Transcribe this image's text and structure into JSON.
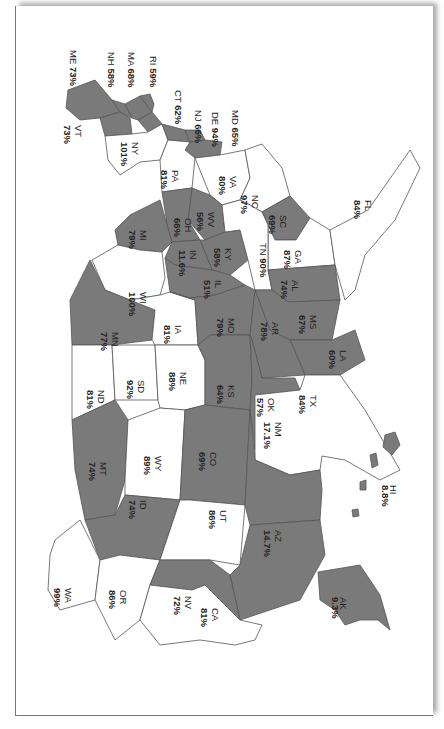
{
  "map": {
    "orientation": "rotated 90 degrees clockwise",
    "colors": {
      "shaded": "#7a7a7a",
      "unshaded": "#ffffff",
      "border": "#555555"
    },
    "states": [
      {
        "code": "ME",
        "value": "73%",
        "shaded": true
      },
      {
        "code": "NH",
        "value": "58%",
        "shaded": true
      },
      {
        "code": "MA",
        "value": "68%",
        "shaded": true
      },
      {
        "code": "RI",
        "value": "59%",
        "shaded": true
      },
      {
        "code": "CT",
        "value": "62%",
        "shaded": true
      },
      {
        "code": "NJ",
        "value": "66%",
        "shaded": true
      },
      {
        "code": "DE",
        "value": "94%",
        "shaded": true
      },
      {
        "code": "MD",
        "value": "65%",
        "shaded": true
      },
      {
        "code": "VT",
        "value": "73%",
        "shaded": true
      },
      {
        "code": "NY",
        "value": "101%",
        "shaded": false
      },
      {
        "code": "PA",
        "value": "81%",
        "shaded": false
      },
      {
        "code": "VA",
        "value": "80%",
        "shaded": false
      },
      {
        "code": "NC",
        "value": "97%",
        "shaded": false
      },
      {
        "code": "SC",
        "value": "69%",
        "shaded": true
      },
      {
        "code": "GA",
        "value": "87%",
        "shaded": false
      },
      {
        "code": "FL",
        "value": "84%",
        "shaded": false
      },
      {
        "code": "WV",
        "value": "56%",
        "shaded": true
      },
      {
        "code": "OH",
        "value": "66%",
        "shaded": true
      },
      {
        "code": "KY",
        "value": "58%",
        "shaded": true
      },
      {
        "code": "TN",
        "value": "90%",
        "shaded": false
      },
      {
        "code": "AL",
        "value": "74%",
        "shaded": true
      },
      {
        "code": "MS",
        "value": "67%",
        "shaded": true
      },
      {
        "code": "LA",
        "value": "60%",
        "shaded": true
      },
      {
        "code": "MI",
        "value": "79%",
        "shaded": true
      },
      {
        "code": "IN",
        "value": "11.6%",
        "shaded": true
      },
      {
        "code": "IL",
        "value": "51%",
        "shaded": true
      },
      {
        "code": "WI",
        "value": "100%",
        "shaded": false
      },
      {
        "code": "MN",
        "value": "77%",
        "shaded": true
      },
      {
        "code": "IA",
        "value": "81%",
        "shaded": false
      },
      {
        "code": "MO",
        "value": "79%",
        "shaded": true
      },
      {
        "code": "AR",
        "value": "78%",
        "shaded": true
      },
      {
        "code": "ND",
        "value": "81%",
        "shaded": false
      },
      {
        "code": "SD",
        "value": "92%",
        "shaded": false
      },
      {
        "code": "NE",
        "value": "88%",
        "shaded": false
      },
      {
        "code": "KS",
        "value": "64%",
        "shaded": true
      },
      {
        "code": "OK",
        "value": "57%",
        "shaded": true
      },
      {
        "code": "TX",
        "value": "84%",
        "shaded": false
      },
      {
        "code": "MT",
        "value": "74%",
        "shaded": true
      },
      {
        "code": "WY",
        "value": "89%",
        "shaded": false
      },
      {
        "code": "CO",
        "value": "69%",
        "shaded": true
      },
      {
        "code": "NM",
        "value": "17.1%",
        "shaded": true
      },
      {
        "code": "ID",
        "value": "74%",
        "shaded": true
      },
      {
        "code": "UT",
        "value": "86%",
        "shaded": false
      },
      {
        "code": "AZ",
        "value": "14.7%",
        "shaded": true
      },
      {
        "code": "WA",
        "value": "99%",
        "shaded": false
      },
      {
        "code": "OR",
        "value": "86%",
        "shaded": false
      },
      {
        "code": "NV",
        "value": "72%",
        "shaded": true
      },
      {
        "code": "CA",
        "value": "81%",
        "shaded": false
      },
      {
        "code": "HI",
        "value": "8.8%",
        "shaded": true
      },
      {
        "code": "AK",
        "value": "9.3%",
        "shaded": true
      }
    ]
  },
  "chart_data": {
    "type": "choropleth",
    "title": "",
    "categories": [
      "ME",
      "NH",
      "MA",
      "RI",
      "CT",
      "NJ",
      "DE",
      "MD",
      "VT",
      "NY",
      "PA",
      "VA",
      "NC",
      "SC",
      "GA",
      "FL",
      "WV",
      "OH",
      "KY",
      "TN",
      "AL",
      "MS",
      "LA",
      "MI",
      "IN",
      "IL",
      "WI",
      "MN",
      "IA",
      "MO",
      "AR",
      "ND",
      "SD",
      "NE",
      "KS",
      "OK",
      "TX",
      "MT",
      "WY",
      "CO",
      "NM",
      "ID",
      "UT",
      "AZ",
      "WA",
      "OR",
      "NV",
      "CA",
      "HI",
      "AK"
    ],
    "values": [
      73,
      58,
      68,
      59,
      62,
      66,
      94,
      65,
      73,
      101,
      81,
      80,
      97,
      69,
      87,
      84,
      56,
      66,
      58,
      90,
      74,
      67,
      60,
      79,
      11.6,
      51,
      100,
      77,
      81,
      79,
      78,
      81,
      92,
      88,
      64,
      57,
      84,
      74,
      89,
      69,
      17.1,
      74,
      86,
      14.7,
      99,
      86,
      72,
      81,
      8.8,
      9.3
    ],
    "units": "%",
    "shaded_states": [
      "ME",
      "NH",
      "MA",
      "RI",
      "CT",
      "NJ",
      "DE",
      "MD",
      "VT",
      "SC",
      "WV",
      "OH",
      "KY",
      "AL",
      "MS",
      "LA",
      "MI",
      "IN",
      "IL",
      "MN",
      "MO",
      "AR",
      "KS",
      "OK",
      "MT",
      "CO",
      "NM",
      "ID",
      "AZ",
      "NV",
      "HI",
      "AK"
    ]
  }
}
